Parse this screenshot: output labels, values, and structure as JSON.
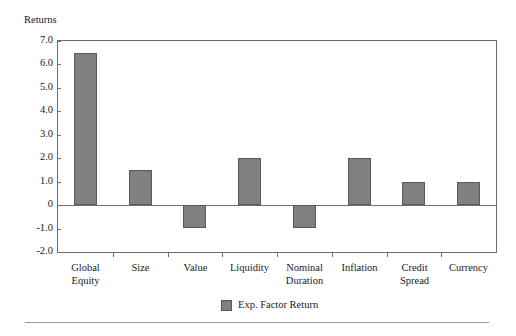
{
  "chart_data": {
    "type": "bar",
    "title": "",
    "subtitle": "",
    "xlabel": "",
    "ylabel": "Returns",
    "ylim": [
      -2.0,
      7.0
    ],
    "ytick_values": [
      7.0,
      6.0,
      5.0,
      4.0,
      3.0,
      2.0,
      1.0,
      0.0,
      -1.0,
      -2.0
    ],
    "ytick_labels": [
      "7.0",
      "6.0",
      "5.0",
      "4.0",
      "3.0",
      "2.0",
      "1.0",
      "0",
      "-1.0",
      "-2.0"
    ],
    "grid": false,
    "legend_position": "bottom-center",
    "categories": [
      "Global Equity",
      "Size",
      "Value",
      "Liquidity",
      "Nominal Duration",
      "Inflation",
      "Credit Spread",
      "Currency"
    ],
    "category_lines": [
      [
        "Global",
        "Equity"
      ],
      [
        "Size",
        ""
      ],
      [
        "Value",
        ""
      ],
      [
        "Liquidity",
        ""
      ],
      [
        "Nominal",
        "Duration"
      ],
      [
        "Inflation",
        ""
      ],
      [
        "Credit",
        "Spread"
      ],
      [
        "Currency",
        ""
      ]
    ],
    "series": [
      {
        "name": "Exp. Factor Return",
        "values": [
          6.5,
          1.5,
          -1.0,
          2.0,
          -1.0,
          2.0,
          1.0,
          1.0
        ],
        "color": "#808080"
      }
    ]
  },
  "legend": {
    "entries": [
      {
        "label": "Exp. Factor Return",
        "color": "#808080"
      }
    ]
  },
  "colors": {
    "bar_fill": "#808080",
    "bar_edge": "#595959",
    "axis": "#6e6e6e",
    "text": "#1a1a1a",
    "rule": "#9a9a9a",
    "background": "#ffffff"
  }
}
